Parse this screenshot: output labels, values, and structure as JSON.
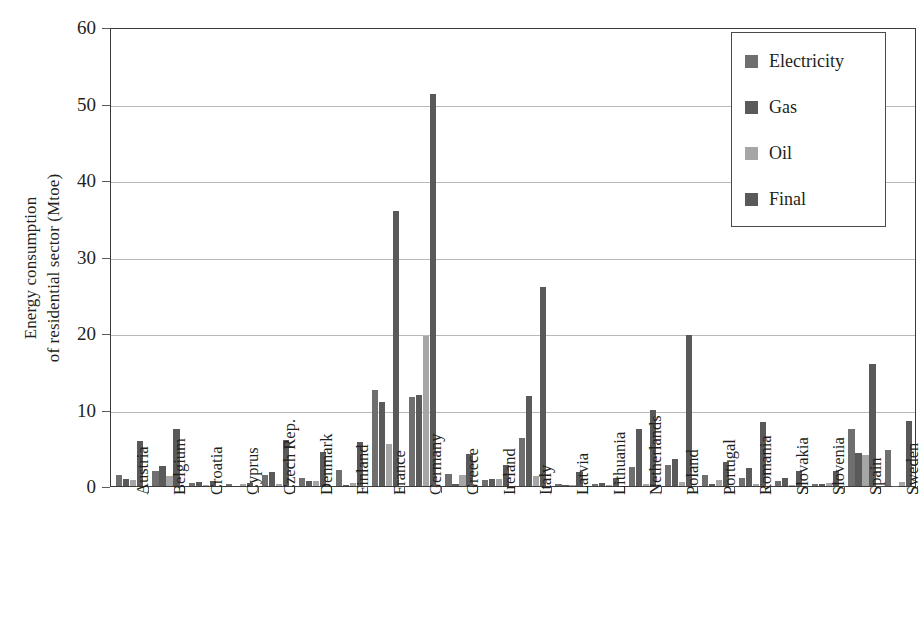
{
  "chart_data": {
    "type": "bar",
    "title": "",
    "subtitle": "",
    "xlabel": "",
    "ylabel": "Energy consumption\nof residential sector (Mtoe)",
    "ylim": [
      0,
      60
    ],
    "yticks": [
      0,
      10,
      20,
      30,
      40,
      50,
      60
    ],
    "ytick_labels": [
      "0",
      "10",
      "20",
      "30",
      "40",
      "50",
      "60"
    ],
    "grid": true,
    "grid_axis": "y",
    "legend_position": "top-right",
    "legend": [
      "Electricity",
      "Gas",
      "Oil",
      "Final"
    ],
    "colors": {
      "Electricity": "#6f6f6f",
      "Gas": "#5a5a5a",
      "Oil": "#a6a6a6",
      "Final": "#595959",
      "axis": "#3b3b3b",
      "gridline": "#b9b9b9",
      "text": "#231f20"
    },
    "categories": [
      "Austria",
      "Belgium",
      "Croatia",
      "Cyprus",
      "Czech Rep.",
      "Denmark",
      "Finland",
      "France",
      "Germany",
      "Greece",
      "Ireland",
      "Italy",
      "Latvia",
      "Lithuania",
      "Netherlands",
      "Poland",
      "Portugal",
      "Romania",
      "Slovakia",
      "Slovenia",
      "Spain",
      "Sweden"
    ],
    "series": [
      {
        "name": "Electricity",
        "values": [
          1.4,
          1.9,
          0.4,
          0.25,
          1.5,
          1.1,
          2.1,
          12.5,
          11.7,
          1.6,
          0.8,
          6.3,
          0.2,
          0.25,
          2.5,
          2.8,
          1.4,
          1.1,
          0.6,
          0.3,
          7.4,
          4.7
        ]
      },
      {
        "name": "Gas",
        "values": [
          0.9,
          2.6,
          0.5,
          0.0,
          1.8,
          0.7,
          0.1,
          11.0,
          11.9,
          0.2,
          0.9,
          11.8,
          0.15,
          0.4,
          7.4,
          3.5,
          0.2,
          2.3,
          1.1,
          0.25,
          4.3,
          0.05
        ]
      },
      {
        "name": "Oil",
        "values": [
          0.8,
          1.3,
          0.15,
          0.2,
          0.2,
          0.6,
          0.35,
          5.5,
          19.6,
          1.4,
          0.9,
          1.3,
          0.1,
          0.15,
          0.3,
          0.5,
          0.8,
          0.3,
          0.1,
          0.35,
          4.1,
          0.5
        ]
      },
      {
        "name": "Final",
        "values": [
          5.9,
          7.5,
          0.7,
          0.35,
          6.0,
          4.4,
          5.8,
          36.0,
          51.2,
          4.2,
          2.8,
          26.0,
          1.8,
          1.1,
          9.9,
          19.7,
          3.1,
          8.4,
          1.9,
          1.9,
          16.0,
          8.5
        ]
      }
    ]
  }
}
